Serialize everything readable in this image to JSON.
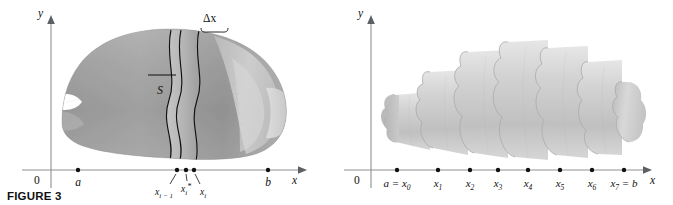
{
  "figure": {
    "caption": "FIGURE 3",
    "panels": [
      {
        "id": "left-panel",
        "title": "solid-with-slab",
        "axes": {
          "y_label": "y",
          "x_label": "x",
          "origin_label": "0"
        },
        "solid_label": "S",
        "thickness_label": "Δx",
        "ticks": [
          {
            "label": "a",
            "x": 78
          },
          {
            "label": "x",
            "sub": "i − 1",
            "x": 177,
            "leader": true
          },
          {
            "label": "x",
            "sub": "i",
            "sup": "*",
            "x": 186,
            "leader": true
          },
          {
            "label": "x",
            "sub": "i",
            "x": 194,
            "leader": true
          },
          {
            "label": "b",
            "x": 268
          }
        ]
      },
      {
        "id": "right-panel",
        "title": "stepped-cylinder-approximation",
        "axes": {
          "y_label": "y",
          "x_label": "x",
          "origin_label": "0"
        },
        "ticks": [
          {
            "label": "a = x",
            "sub": "0",
            "x": 397
          },
          {
            "label": "x",
            "sub": "1",
            "x": 438
          },
          {
            "label": "x",
            "sub": "2",
            "x": 470
          },
          {
            "label": "x",
            "sub": "3",
            "x": 498
          },
          {
            "label": "x",
            "sub": "4",
            "x": 528
          },
          {
            "label": "x",
            "sub": "5",
            "x": 560
          },
          {
            "label": "x",
            "sub": "6",
            "x": 592
          },
          {
            "label": "x",
            "sub": "7",
            "suffix": " = b",
            "x": 624
          }
        ]
      }
    ],
    "colors": {
      "background": "#ffffff",
      "axis": "#8d8f92",
      "solid_mid": "#9a9a9a",
      "solid_light": "#cfcfcf",
      "solid_dark": "#7b7b7b",
      "stepped_mid": "#c6c6c6",
      "stepped_light": "#e2e2e2",
      "stepped_dark": "#a8a8a8",
      "ink": "#111111"
    }
  }
}
